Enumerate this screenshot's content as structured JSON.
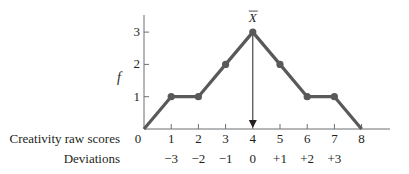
{
  "chart_data": {
    "type": "line",
    "title": "",
    "xlabel": "Creativity raw scores",
    "ylabel": "f",
    "secondary_xlabel": "Deviations",
    "x": [
      0,
      1,
      2,
      3,
      4,
      5,
      6,
      7,
      8
    ],
    "values": [
      0,
      1,
      1,
      2,
      3,
      2,
      1,
      1,
      0
    ],
    "x_tick_labels": [
      "0",
      "1",
      "2",
      "3",
      "4",
      "5",
      "6",
      "7",
      "8"
    ],
    "y_tick_labels": [
      "1",
      "2",
      "3"
    ],
    "deviation_labels": [
      "−3",
      "−2",
      "−1",
      "0",
      "+1",
      "+2",
      "+3"
    ],
    "deviation_positions": [
      1,
      2,
      3,
      4,
      5,
      6,
      7
    ],
    "xlim": [
      0,
      9
    ],
    "ylim": [
      0,
      3.5
    ],
    "grid": false,
    "annotations": [
      {
        "text": "X̅",
        "label": "mean",
        "x": 4,
        "y": 3,
        "arrow_to_x_axis": true
      }
    ],
    "line_color": "#58595b"
  },
  "labels": {
    "xlabel": "Creativity raw scores",
    "ylabel": "f",
    "deviations": "Deviations",
    "mean": "X"
  }
}
